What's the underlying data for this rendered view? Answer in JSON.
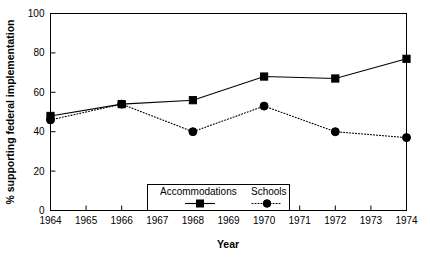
{
  "chart_data": {
    "type": "line",
    "title": "",
    "xlabel": "Year",
    "ylabel": "% supporting federal implementation",
    "x": [
      1964,
      1966,
      1968,
      1970,
      1972,
      1974
    ],
    "xticklabels": [
      "1964",
      "1965",
      "1966",
      "1967",
      "1968",
      "1969",
      "1970",
      "1971",
      "1972",
      "1973",
      "1974"
    ],
    "xlim": [
      1964,
      1974
    ],
    "ylim": [
      0,
      100
    ],
    "yticks": [
      0,
      20,
      40,
      60,
      80,
      100
    ],
    "yticklabels": [
      "0",
      "20",
      "40",
      "60",
      "80",
      "100"
    ],
    "grid": false,
    "legend_position": "inside-bottom-center",
    "series": [
      {
        "name": "Accommodations",
        "marker": "square",
        "linestyle": "solid",
        "color": "#000000",
        "values": [
          48,
          54,
          56,
          68,
          67,
          77
        ]
      },
      {
        "name": "Schools",
        "marker": "circle",
        "linestyle": "dotted",
        "color": "#000000",
        "values": [
          46,
          54,
          40,
          53,
          40,
          37
        ]
      }
    ]
  },
  "legend": {
    "entries": [
      {
        "label": "Accommodations"
      },
      {
        "label": "Schools"
      }
    ]
  },
  "axes": {
    "x_title": "Year",
    "y_title": "% supporting federal implementation"
  }
}
